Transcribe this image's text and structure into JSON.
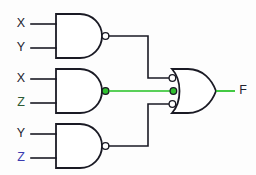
{
  "diagram": {
    "type": "logic-gate-schematic",
    "colors": {
      "wire": "#1a1a24",
      "highlight": "#22c022",
      "background": "#fdfdfd",
      "gate_fill": "#ffffff"
    },
    "inputs": [
      {
        "id": "in-1a",
        "label": "X"
      },
      {
        "id": "in-1b",
        "label": "Y"
      },
      {
        "id": "in-2a",
        "label": "X"
      },
      {
        "id": "in-2b",
        "label": "Z"
      },
      {
        "id": "in-3a",
        "label": "Y"
      },
      {
        "id": "in-3b",
        "label": "Z"
      }
    ],
    "gates": [
      {
        "id": "gate-nand-1",
        "type": "NAND",
        "inputs": [
          "X",
          "Y"
        ],
        "inverted_output": true,
        "highlighted": false
      },
      {
        "id": "gate-nand-2",
        "type": "NAND",
        "inputs": [
          "X",
          "Z"
        ],
        "inverted_output": true,
        "highlighted": true
      },
      {
        "id": "gate-nand-3",
        "type": "NAND",
        "inputs": [
          "Y",
          "Z"
        ],
        "inverted_output": true,
        "highlighted": false
      },
      {
        "id": "gate-or-out",
        "type": "OR",
        "input_count": 3,
        "inverted_inputs": true,
        "inverted_output": false,
        "highlighted_input_index": 1
      }
    ],
    "nets": [
      {
        "id": "net-nand1-or",
        "from": "gate-nand-1",
        "to": "gate-or-out",
        "highlighted": false
      },
      {
        "id": "net-nand2-or",
        "from": "gate-nand-2",
        "to": "gate-or-out",
        "highlighted": true
      },
      {
        "id": "net-nand3-or",
        "from": "gate-nand-3",
        "to": "gate-or-out",
        "highlighted": false
      }
    ],
    "output": {
      "id": "out-f",
      "label": "F",
      "highlighted": true
    }
  }
}
